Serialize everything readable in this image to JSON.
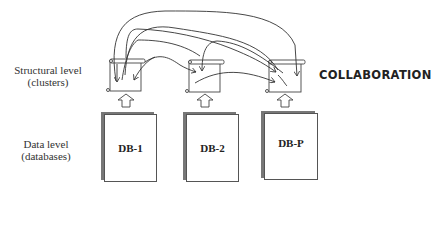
{
  "levels": {
    "structural": {
      "line1": "Structural level",
      "line2": "(clusters)"
    },
    "data": {
      "line1": "Data level",
      "line2": "(databases)"
    }
  },
  "collaboration_label": "COLLABORATION",
  "databases": [
    {
      "label": "DB-1"
    },
    {
      "label": "DB-2"
    },
    {
      "label": "DB-P"
    }
  ],
  "icons": {
    "cluster": "scroll-icon",
    "upward": "up-arrow-icon"
  }
}
